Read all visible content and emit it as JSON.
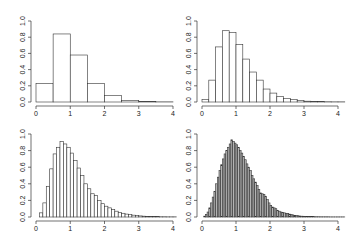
{
  "chart_data": [
    {
      "type": "bar",
      "panel": "top-left",
      "title": "",
      "xlabel": "",
      "ylabel": "",
      "xlim": [
        0,
        4
      ],
      "ylim": [
        0,
        1.0
      ],
      "xticks": [
        "0",
        "1",
        "2",
        "3",
        "4"
      ],
      "yticks": [
        "0.0",
        "0.2",
        "0.4",
        "0.6",
        "0.8",
        "1.0"
      ],
      "grid": false,
      "bin_width": 0.5,
      "fill": "#ffffff",
      "bins_start": [
        0,
        0.5,
        1.0,
        1.5,
        2.0,
        2.5,
        3.0,
        3.5
      ],
      "values": [
        0.23,
        0.84,
        0.58,
        0.23,
        0.08,
        0.02,
        0.005,
        0.002
      ]
    },
    {
      "type": "bar",
      "panel": "top-right",
      "title": "",
      "xlabel": "",
      "ylabel": "",
      "xlim": [
        0,
        4
      ],
      "ylim": [
        0,
        1.0
      ],
      "xticks": [
        "0",
        "1",
        "2",
        "3",
        "4"
      ],
      "yticks": [
        "0.0",
        "0.2",
        "0.4",
        "0.6",
        "0.8",
        "1.0"
      ],
      "grid": false,
      "bin_width": 0.2,
      "fill": "#ffffff",
      "bins_start": [
        0,
        0.2,
        0.4,
        0.6,
        0.8,
        1.0,
        1.2,
        1.4,
        1.6,
        1.8,
        2.0,
        2.2,
        2.4,
        2.6,
        2.8,
        3.0,
        3.2,
        3.4,
        3.6,
        3.8,
        4.0
      ],
      "values": [
        0.03,
        0.27,
        0.68,
        0.88,
        0.86,
        0.71,
        0.53,
        0.37,
        0.27,
        0.16,
        0.11,
        0.07,
        0.045,
        0.03,
        0.02,
        0.01,
        0.006,
        0.004,
        0.003,
        0.002,
        0.002
      ]
    },
    {
      "type": "bar",
      "panel": "bottom-left",
      "title": "",
      "xlabel": "",
      "ylabel": "",
      "xlim": [
        0,
        4
      ],
      "ylim": [
        0,
        1.0
      ],
      "xticks": [
        "0",
        "1",
        "2",
        "3",
        "4"
      ],
      "yticks": [
        "0.0",
        "0.2",
        "0.4",
        "0.6",
        "0.8",
        "1.0"
      ],
      "grid": false,
      "bin_width": 0.1,
      "fill": "#ffffff",
      "bins_start_from": 0,
      "values": [
        0.0,
        0.05,
        0.17,
        0.37,
        0.58,
        0.76,
        0.84,
        0.91,
        0.88,
        0.84,
        0.77,
        0.68,
        0.59,
        0.5,
        0.4,
        0.34,
        0.28,
        0.26,
        0.2,
        0.16,
        0.13,
        0.11,
        0.09,
        0.07,
        0.055,
        0.045,
        0.035,
        0.028,
        0.022,
        0.017,
        0.013,
        0.01,
        0.008,
        0.006,
        0.005,
        0.004,
        0.003,
        0.003,
        0.002,
        0.002,
        0.002
      ]
    },
    {
      "type": "bar",
      "panel": "bottom-right",
      "title": "",
      "xlabel": "",
      "ylabel": "",
      "xlim": [
        0,
        4
      ],
      "ylim": [
        0,
        1.0
      ],
      "xticks": [
        "0",
        "1",
        "2",
        "3",
        "4"
      ],
      "yticks": [
        "0.0",
        "0.2",
        "0.4",
        "0.6",
        "0.8",
        "1.0"
      ],
      "grid": false,
      "bin_width": 0.05,
      "fill": "#b4b4b4",
      "bins_start_from": 0,
      "values": [
        0.0,
        0.01,
        0.03,
        0.06,
        0.11,
        0.17,
        0.24,
        0.31,
        0.4,
        0.48,
        0.56,
        0.63,
        0.7,
        0.76,
        0.8,
        0.84,
        0.88,
        0.93,
        0.91,
        0.89,
        0.87,
        0.84,
        0.8,
        0.77,
        0.73,
        0.69,
        0.64,
        0.6,
        0.56,
        0.5,
        0.46,
        0.42,
        0.38,
        0.33,
        0.29,
        0.28,
        0.27,
        0.25,
        0.21,
        0.17,
        0.14,
        0.12,
        0.11,
        0.1,
        0.08,
        0.07,
        0.06,
        0.055,
        0.05,
        0.045,
        0.04,
        0.035,
        0.03,
        0.025,
        0.02,
        0.018,
        0.015,
        0.012,
        0.01,
        0.009,
        0.008,
        0.007,
        0.006,
        0.005,
        0.004,
        0.004,
        0.003,
        0.003,
        0.003,
        0.002,
        0.002,
        0.002,
        0.002,
        0.002,
        0.002,
        0.001,
        0.001,
        0.001,
        0.001,
        0.001,
        0.001,
        0.001,
        0.001,
        0.001
      ]
    }
  ],
  "layout": {
    "panels": [
      {
        "name": "top-left",
        "x": 0,
        "y": 0
      },
      {
        "name": "top-right",
        "x": 180,
        "y": 0
      },
      {
        "name": "bottom-left",
        "x": 0,
        "y": 120
      },
      {
        "name": "bottom-right",
        "x": 180,
        "y": 120
      }
    ]
  }
}
